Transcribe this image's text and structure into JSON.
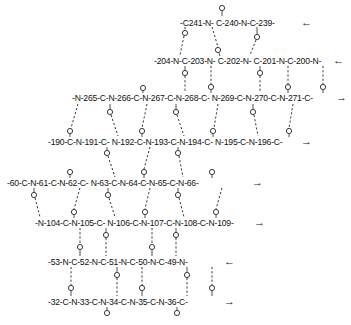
{
  "diagram": {
    "type": "beta-sheet hydrogen bonding diagram",
    "strands": [
      {
        "id": "s1",
        "text": "-C241-N- C-240-N-C-239-",
        "direction": "left",
        "arrow": "←",
        "x": 180,
        "y": 18,
        "arrow_x": 301
      },
      {
        "id": "s2",
        "text": "-204-N-C-203-N- C-202-N- C-201-N-C-200-N-",
        "direction": "left",
        "arrow": "←",
        "x": 154,
        "y": 56,
        "arrow_x": 332
      },
      {
        "id": "s3",
        "text": "-N-265-C-N-266-C-N-267-C-N-268-C- N-269-C-N-270-C-N-271-C-",
        "direction": "right",
        "arrow": "→",
        "x": 72,
        "y": 93,
        "arrow_x": 336
      },
      {
        "id": "s4",
        "text": "-190-C-N-191-C- N-192-C-N-193-C-N-194-C- N-195-C-N-196-C-",
        "direction": "right",
        "arrow": "→",
        "x": 48,
        "y": 137,
        "arrow_x": 301
      },
      {
        "id": "s5",
        "text": "-60-C-N-61-C-N-62-C- N-63-C-N-64-C-N-65-C-N-66-",
        "direction": "right",
        "arrow": "→",
        "x": 7,
        "y": 178,
        "arrow_x": 252
      },
      {
        "id": "s6",
        "text": "-N-104-C-N-105-C- N-106-C-N-107-C-N-108-C-N-109-",
        "direction": "right",
        "arrow": "→",
        "x": 35,
        "y": 218,
        "arrow_x": 254
      },
      {
        "id": "s7",
        "text": "-53-N-C-52-N-C-51-N-C-50-N-C-49-N-",
        "direction": "left",
        "arrow": "←",
        "x": 48,
        "y": 257,
        "arrow_x": 224
      },
      {
        "id": "s8",
        "text": "-32-C-N-33-C-N-34-C-N-35-C-N-36-C-",
        "direction": "right",
        "arrow": "→",
        "x": 48,
        "y": 297,
        "arrow_x": 224
      }
    ],
    "oxygen_label": "O"
  }
}
